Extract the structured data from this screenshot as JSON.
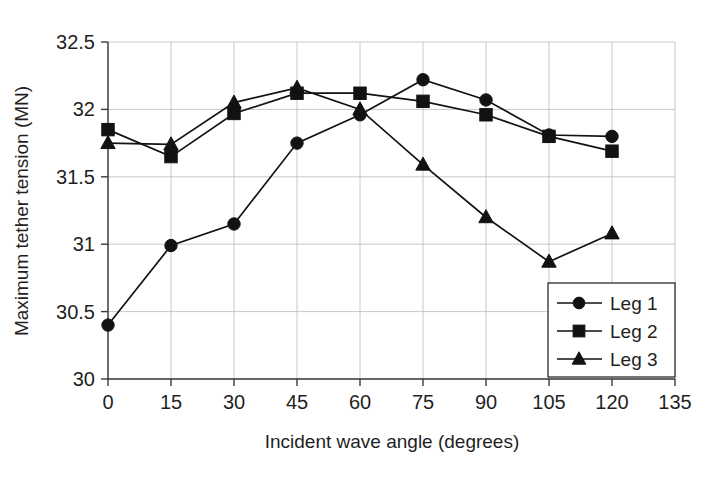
{
  "chart_data": {
    "type": "line",
    "title": "",
    "xlabel": "Incident wave angle (degrees)",
    "ylabel": "Maximum tether tension (MN)",
    "x": [
      0,
      15,
      30,
      45,
      60,
      75,
      90,
      105,
      120
    ],
    "xlim": [
      0,
      135
    ],
    "ylim": [
      30,
      32.5
    ],
    "xticks": [
      "0",
      "15",
      "30",
      "45",
      "60",
      "75",
      "90",
      "105",
      "120",
      "135"
    ],
    "xtick_values": [
      0,
      15,
      30,
      45,
      60,
      75,
      90,
      105,
      120,
      135
    ],
    "yticks": [
      "30",
      "30.5",
      "31",
      "31.5",
      "32",
      "32.5"
    ],
    "ytick_values": [
      30,
      30.5,
      31,
      31.5,
      32,
      32.5
    ],
    "grid": true,
    "legend_position": "lower right",
    "series": [
      {
        "name": "Leg 1",
        "marker": "circle",
        "values": [
          30.4,
          30.99,
          31.15,
          31.75,
          31.96,
          32.22,
          32.07,
          31.81,
          31.8
        ]
      },
      {
        "name": "Leg 2",
        "marker": "square",
        "values": [
          31.85,
          31.65,
          31.97,
          32.12,
          32.12,
          32.06,
          31.96,
          31.8,
          31.69
        ]
      },
      {
        "name": "Leg 3",
        "marker": "triangle",
        "values": [
          31.75,
          31.74,
          32.05,
          32.16,
          32.0,
          31.59,
          31.2,
          30.87,
          31.08
        ]
      }
    ],
    "colors": {
      "series": "#121212",
      "grid": "#b9b9c4",
      "axis": "#3b3b3b",
      "background": "#ffffff"
    }
  }
}
